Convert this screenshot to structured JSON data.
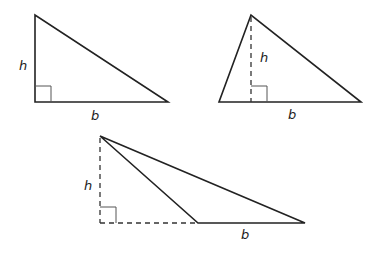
{
  "diagram": {
    "triangles": [
      {
        "type": "right",
        "vertices": [
          [
            35,
            15
          ],
          [
            35,
            102
          ],
          [
            168,
            102
          ]
        ],
        "height_line": {
          "from": [
            35,
            15
          ],
          "to": [
            35,
            102
          ],
          "style": "solid"
        },
        "right_angle_box": [
          35,
          86,
          16
        ],
        "labels": {
          "h": "h",
          "b": "b"
        },
        "label_pos": {
          "h": [
            19,
            70
          ],
          "b": [
            91,
            120
          ]
        }
      },
      {
        "type": "acute",
        "vertices": [
          [
            251,
            15
          ],
          [
            219,
            102
          ],
          [
            361,
            102
          ]
        ],
        "height_line": {
          "from": [
            251,
            15
          ],
          "to": [
            251,
            102
          ],
          "style": "dashed"
        },
        "right_angle_box": [
          251,
          86,
          16
        ],
        "labels": {
          "h": "h",
          "b": "b"
        },
        "label_pos": {
          "h": [
            260,
            62
          ],
          "b": [
            288,
            119
          ]
        }
      },
      {
        "type": "obtuse",
        "vertices": [
          [
            100,
            136
          ],
          [
            198,
            223
          ],
          [
            305,
            223
          ]
        ],
        "height_line": {
          "from": [
            100,
            136
          ],
          "to": [
            100,
            223
          ],
          "style": "dashed"
        },
        "base_extension": {
          "from": [
            100,
            223
          ],
          "to": [
            198,
            223
          ],
          "style": "dashed"
        },
        "right_angle_box": [
          100,
          207,
          16
        ],
        "labels": {
          "h": "h",
          "b": "b"
        },
        "label_pos": {
          "h": [
            84,
            190
          ],
          "b": [
            241,
            239
          ]
        }
      }
    ]
  }
}
